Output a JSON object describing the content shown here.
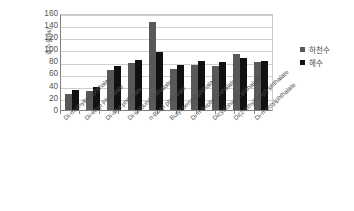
{
  "chart_data": {
    "type": "bar",
    "title": "",
    "xlabel": "",
    "ylabel": "회수율[%]",
    "ylim": [
      0,
      160
    ],
    "ytick_step": 20,
    "yticks": [
      160,
      140,
      120,
      100,
      80,
      60,
      40,
      20,
      0
    ],
    "grid": true,
    "legend_position": "right",
    "categories": [
      "Di-methylterephthalate",
      "Di-ethyl Phthalate",
      "Di-allyl phthalate",
      "Di-isobutyl phthalate",
      "n-Butyl phthalate",
      "Butyl benzyl phthalate",
      "Di-n-heptyl phthalate",
      "Dicyclohexyl phthalate",
      "Di(2-ethylhexyl) phthalate",
      "Di-n-octylphthalate"
    ],
    "series": [
      {
        "name": "하천수",
        "color": "#595959",
        "values": [
          27,
          31,
          66,
          77,
          146,
          68,
          74,
          73,
          92,
          79
        ]
      },
      {
        "name": "해수",
        "color": "#111111",
        "values": [
          33,
          38,
          72,
          83,
          95,
          75,
          81,
          79,
          85,
          81
        ]
      }
    ]
  },
  "legend": {
    "items": [
      {
        "label": "하천수"
      },
      {
        "label": "해수"
      }
    ]
  }
}
